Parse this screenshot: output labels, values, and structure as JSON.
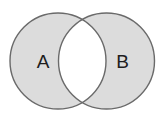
{
  "diagram": {
    "type": "venn",
    "operation": "symmetric-difference",
    "sets": [
      {
        "id": "A",
        "label": "A",
        "cx": 58,
        "cy": 61,
        "r": 48
      },
      {
        "id": "B",
        "label": "B",
        "cx": 106.5,
        "cy": 61,
        "r": 48
      }
    ],
    "intersection_shaded": false,
    "colors": {
      "fill": "#dcdcdc",
      "stroke": "#6a6a6a",
      "intersection": "#ffffff",
      "label": "#1e1e1e"
    }
  }
}
